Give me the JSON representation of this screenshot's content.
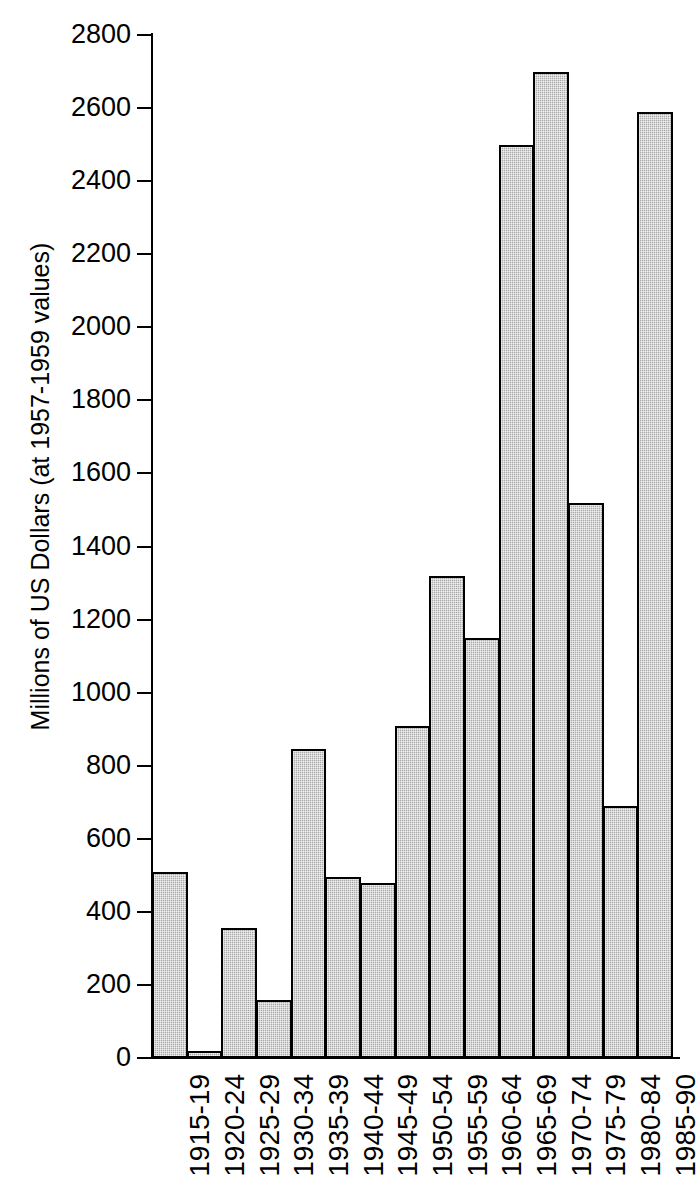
{
  "chart_data": {
    "type": "bar",
    "title": "",
    "xlabel": "",
    "ylabel": "Millions of US Dollars (at 1957-1959 values)",
    "ylim": [
      0,
      2800
    ],
    "ytick_step": 200,
    "yticks": [
      0,
      200,
      400,
      600,
      800,
      1000,
      1200,
      1400,
      1600,
      1800,
      2000,
      2200,
      2400,
      2600,
      2800
    ],
    "ytick_labels": [
      "0",
      "200",
      "400",
      "600",
      "800",
      "1000",
      "1200",
      "1400",
      "1600",
      "1800",
      "2000",
      "2200",
      "2400",
      "2600",
      "2800"
    ],
    "grid": false,
    "legend": null,
    "categories": [
      "1915-19",
      "1920-24",
      "1925-29",
      "1930-34",
      "1935-39",
      "1940-44",
      "1945-49",
      "1950-54",
      "1955-59",
      "1960-64",
      "1965-69",
      "1970-74",
      "1975-79",
      "1980-84",
      "1985-90"
    ],
    "values": [
      510,
      20,
      355,
      160,
      845,
      495,
      480,
      910,
      1320,
      1150,
      2500,
      2700,
      1520,
      690,
      2590
    ],
    "bar_style": {
      "fill_color": "#a9a9a9",
      "edge_color": "#000000",
      "pattern": "stipple",
      "gap": 0
    }
  }
}
